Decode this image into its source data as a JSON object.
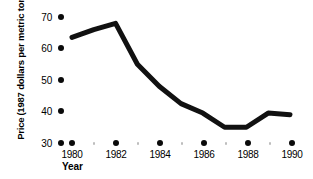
{
  "chart_data": {
    "type": "line",
    "title": "",
    "xlabel": "Year",
    "ylabel": "Price\n(1987 dollars per metric ton)",
    "ylabel_lines": [
      "Price",
      "(1987 dollars per metric ton)"
    ],
    "x": [
      1980,
      1981,
      1982,
      1983,
      1984,
      1985,
      1986,
      1987,
      1988,
      1989,
      1990
    ],
    "values": [
      63.5,
      66.0,
      68.0,
      55.0,
      48.0,
      42.5,
      39.5,
      35.0,
      35.0,
      39.5,
      39.0
    ],
    "series": [
      {
        "name": "Price",
        "values": [
          63.5,
          66.0,
          68.0,
          55.0,
          48.0,
          42.5,
          39.5,
          35.0,
          35.0,
          39.5,
          39.0
        ]
      }
    ],
    "xlim": [
      1979.5,
      1990.5
    ],
    "ylim": [
      30,
      70
    ],
    "yticks": [
      30,
      40,
      50,
      60,
      70
    ],
    "ytick_labels": [
      "30",
      "40",
      "50",
      "60",
      "70"
    ],
    "xticks": [
      1980,
      1982,
      1984,
      1986,
      1988,
      1990
    ],
    "xtick_labels": [
      "1980",
      "1982",
      "1984",
      "1986",
      "1988",
      "1990"
    ],
    "xminor_ticks": [
      1981,
      1983,
      1985,
      1987,
      1989
    ],
    "grid": false,
    "legend": null,
    "legend_position": "none",
    "line_color": "#111111",
    "line_width": 5,
    "tick_marker_style": "dot",
    "major_tick_color": "#0a0a0a",
    "minor_tick_color": "#bdbdbd",
    "background_color": "#ffffff"
  },
  "axis": {
    "y_title_line1": "Price",
    "y_title_line2": "(1987 dollars per metric ton)",
    "x_title": "Year"
  }
}
